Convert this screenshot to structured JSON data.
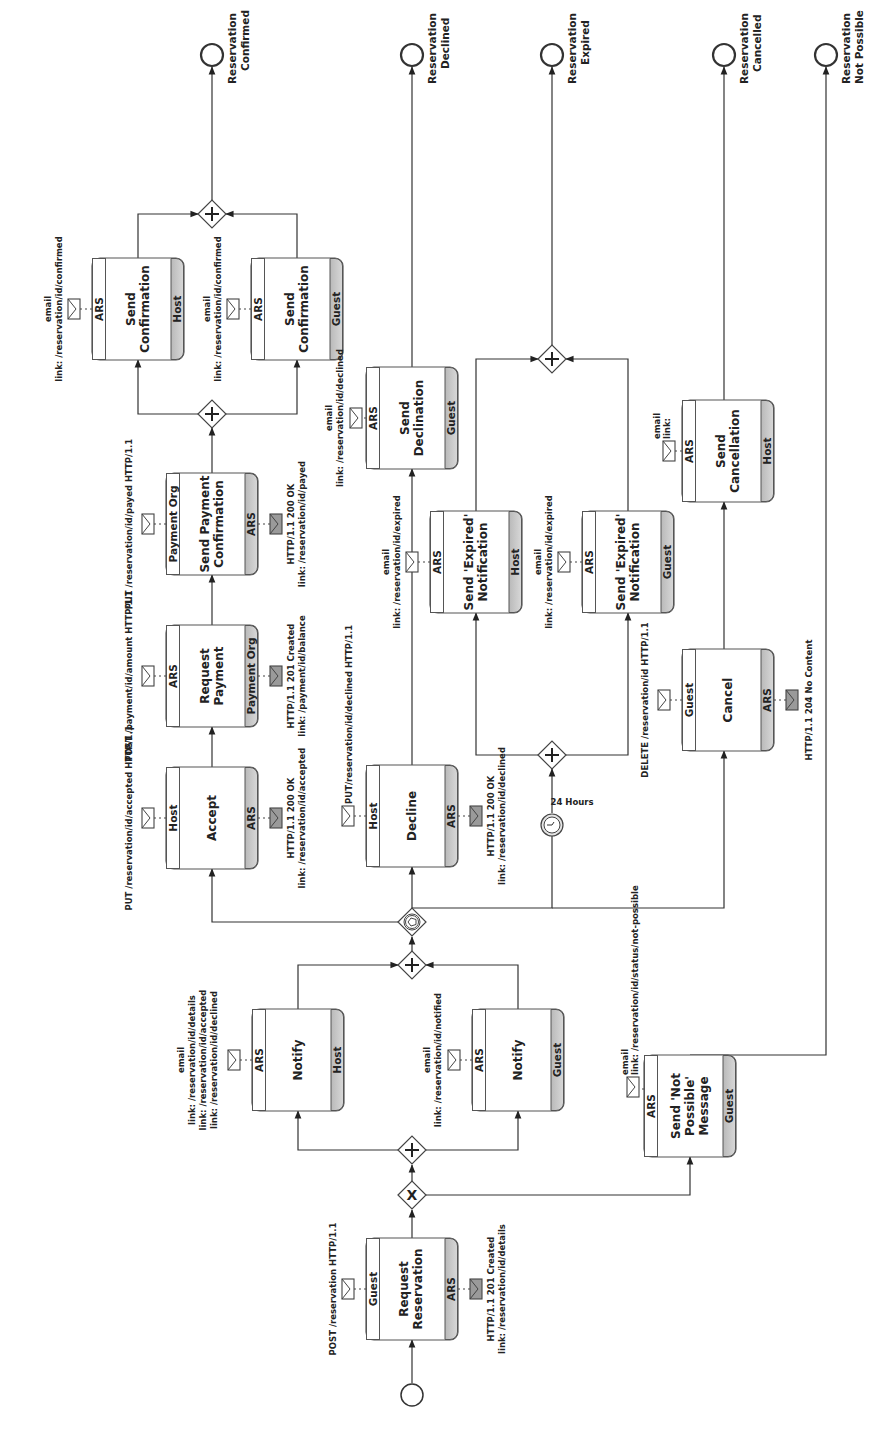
{
  "diagram": {
    "type": "BPMN choreography diagram (rotated 90° counter-clockwise)",
    "start_event": {
      "label": ""
    },
    "tasks": {
      "request_reservation": {
        "name_lines": [
          "Request",
          "Reservation"
        ],
        "initiator": "Guest",
        "responder": "ARS",
        "request_msg": [
          "POST /reservation HTTP/1.1"
        ],
        "response_msg": [
          "HTTP/1.1 201 Created",
          "link: /reservation/id/details"
        ]
      },
      "notify_host": {
        "name_lines": [
          "Notify"
        ],
        "initiator": "ARS",
        "responder": "Host",
        "request_msg": [
          "email",
          "link: /reservation/id/details",
          "link: /reservation/id/accepted",
          "link: /reservation/id/declined"
        ]
      },
      "notify_guest": {
        "name_lines": [
          "Notify"
        ],
        "initiator": "ARS",
        "responder": "Guest",
        "request_msg": [
          "email",
          "link: /reservation/id/notified"
        ]
      },
      "accept": {
        "name_lines": [
          "Accept"
        ],
        "initiator": "Host",
        "responder": "ARS",
        "request_msg": [
          "PUT /reservation/id/accepted HTTP/1.1"
        ],
        "response_msg": [
          "HTTP/1.1 200 OK",
          "link: /reservation/id/accepted"
        ]
      },
      "request_payment": {
        "name_lines": [
          "Request",
          "Payment"
        ],
        "initiator": "ARS",
        "responder": "Payment Org",
        "request_msg": [
          "POST /payment/id/amount HTTP/1.1"
        ],
        "response_msg": [
          "HTTP/1.1 201 Created",
          "link: /payment/id/balance"
        ]
      },
      "send_payment_confirmation": {
        "name_lines": [
          "Send Payment",
          "Confirmation"
        ],
        "initiator": "Payment Org",
        "responder": "ARS",
        "request_msg": [
          "PUT /reservation/id/payed HTTP/1.1"
        ],
        "response_msg": [
          "HTTP/1.1 200 OK",
          "link: /reservation/id/payed"
        ]
      },
      "send_confirmation_host": {
        "name_lines": [
          "Send",
          "Confirmation"
        ],
        "initiator": "ARS",
        "responder": "Host",
        "request_msg": [
          "email",
          "link: /reservation/id/confirmed"
        ]
      },
      "send_confirmation_guest": {
        "name_lines": [
          "Send",
          "Confirmation"
        ],
        "initiator": "ARS",
        "responder": "Guest",
        "request_msg": [
          "email",
          "link: /reservation/id/confirmed"
        ]
      },
      "decline": {
        "name_lines": [
          "Decline"
        ],
        "initiator": "Host",
        "responder": "ARS",
        "request_msg": [
          "PUT/reservation/id/declined HTTP/1.1"
        ],
        "response_msg": [
          "HTTP/1.1 200 OK",
          "link: /reservation/id/declined"
        ]
      },
      "send_declination": {
        "name_lines": [
          "Send",
          "Declination"
        ],
        "initiator": "ARS",
        "responder": "Guest",
        "request_msg": [
          "email",
          "link: /reservation/id/declined"
        ]
      },
      "send_expired_host": {
        "name_lines": [
          "Send 'Expired'",
          "Notification"
        ],
        "initiator": "ARS",
        "responder": "Host",
        "request_msg": [
          "email",
          "link: /reservation/id/expired"
        ]
      },
      "send_expired_guest": {
        "name_lines": [
          "Send 'Expired'",
          "Notification"
        ],
        "initiator": "ARS",
        "responder": "Guest",
        "request_msg": [
          "email",
          "link: /reservation/id/expired"
        ]
      },
      "cancel": {
        "name_lines": [
          "Cancel"
        ],
        "initiator": "Guest",
        "responder": "ARS",
        "request_msg": [
          "DELETE /reservation/id HTTP/1.1"
        ],
        "response_msg": [
          "HTTP/1.1 204 No Content"
        ]
      },
      "send_cancellation": {
        "name_lines": [
          "Send",
          "Cancellation"
        ],
        "initiator": "ARS",
        "responder": "Host",
        "request_msg": [
          "email",
          "link:"
        ]
      },
      "send_not_possible": {
        "name_lines": [
          "Send 'Not",
          "Possible'",
          "Message"
        ],
        "initiator": "ARS",
        "responder": "Guest",
        "request_msg": [
          "email",
          "link: /reservation/id/status/not-possible"
        ]
      }
    },
    "timer": {
      "label": "24 Hours"
    },
    "gateways": {
      "exclusive": {
        "symbol": "X"
      },
      "parallel": {
        "symbol": "+"
      },
      "event_based": {
        "symbol": "⬠"
      }
    },
    "end_events": {
      "confirmed": [
        "Reservation",
        "Confirmed"
      ],
      "declined": [
        "Reservation",
        "Declined"
      ],
      "expired": [
        "Reservation",
        "Expired"
      ],
      "cancelled": [
        "Reservation",
        "Cancelled"
      ],
      "not_possible": [
        "Reservation",
        "Not Possible"
      ]
    }
  }
}
